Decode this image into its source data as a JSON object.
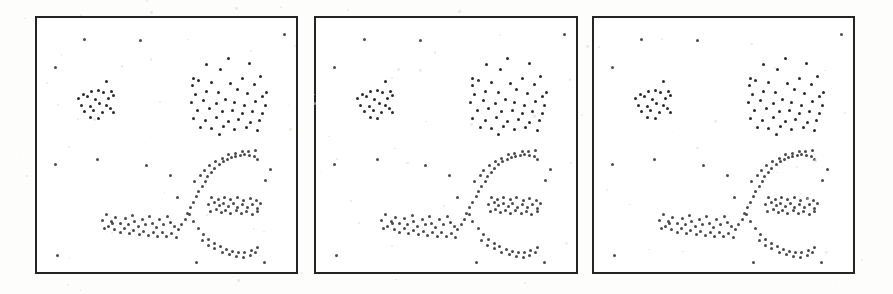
{
  "figure": {
    "name": "three-panel-scatter-cluster-figure",
    "background_color": "#fdfdfc",
    "panel_border_color": "#242424",
    "point_color": "#3a3a3a",
    "panel_count": 3
  },
  "panels": [
    {
      "id": "panel-1",
      "label": "",
      "x": 35,
      "y": 16,
      "width": 263,
      "height": 258
    },
    {
      "id": "panel-2",
      "label": "",
      "x": 314,
      "y": 16,
      "width": 264,
      "height": 258
    },
    {
      "id": "panel-3",
      "label": "",
      "x": 592,
      "y": 16,
      "width": 263,
      "height": 258
    }
  ],
  "chart_data": {
    "type": "scatter",
    "title": "",
    "subtitle": "",
    "xlabel": "",
    "ylabel": "",
    "xlim": [
      0,
      1
    ],
    "ylim": [
      0,
      1
    ],
    "grid": false,
    "legend": "none",
    "axis_ticks": false,
    "note": "Three identical panels each showing the same 2-D point set: a small compact cluster upper-left, a large diffuse cluster upper-right, a long curved (arc/banana) cluster across the lower half, plus sparse uniform noise points. Coordinates are normalized 0-1 with origin at the panel's top-left, x to the right and y downward.",
    "panels_share_data": true,
    "clusters": [
      {
        "name": "small-compact-cluster",
        "style": "dense",
        "count": 22,
        "points": [
          [
            0.262,
            0.245
          ],
          [
            0.175,
            0.296
          ],
          [
            0.206,
            0.286
          ],
          [
            0.232,
            0.281
          ],
          [
            0.251,
            0.289
          ],
          [
            0.283,
            0.283
          ],
          [
            0.155,
            0.313
          ],
          [
            0.19,
            0.305
          ],
          [
            0.221,
            0.316
          ],
          [
            0.271,
            0.312
          ],
          [
            0.29,
            0.301
          ],
          [
            0.167,
            0.338
          ],
          [
            0.2,
            0.345
          ],
          [
            0.238,
            0.332
          ],
          [
            0.262,
            0.34
          ],
          [
            0.18,
            0.364
          ],
          [
            0.215,
            0.358
          ],
          [
            0.248,
            0.369
          ],
          [
            0.279,
            0.352
          ],
          [
            0.29,
            0.366
          ],
          [
            0.203,
            0.388
          ],
          [
            0.232,
            0.392
          ]
        ]
      },
      {
        "name": "large-diffuse-cluster",
        "style": "dense",
        "count": 48,
        "points": [
          [
            0.735,
            0.153
          ],
          [
            0.652,
            0.176
          ],
          [
            0.818,
            0.172
          ],
          [
            0.6,
            0.232
          ],
          [
            0.62,
            0.24
          ],
          [
            0.705,
            0.198
          ],
          [
            0.79,
            0.233
          ],
          [
            0.862,
            0.226
          ],
          [
            0.598,
            0.262
          ],
          [
            0.672,
            0.248
          ],
          [
            0.745,
            0.252
          ],
          [
            0.836,
            0.256
          ],
          [
            0.885,
            0.288
          ],
          [
            0.608,
            0.295
          ],
          [
            0.65,
            0.286
          ],
          [
            0.697,
            0.29
          ],
          [
            0.77,
            0.275
          ],
          [
            0.81,
            0.293
          ],
          [
            0.867,
            0.305
          ],
          [
            0.592,
            0.33
          ],
          [
            0.64,
            0.322
          ],
          [
            0.688,
            0.333
          ],
          [
            0.724,
            0.318
          ],
          [
            0.76,
            0.33
          ],
          [
            0.8,
            0.338
          ],
          [
            0.842,
            0.326
          ],
          [
            0.878,
            0.338
          ],
          [
            0.616,
            0.36
          ],
          [
            0.662,
            0.352
          ],
          [
            0.712,
            0.365
          ],
          [
            0.752,
            0.358
          ],
          [
            0.792,
            0.37
          ],
          [
            0.83,
            0.362
          ],
          [
            0.87,
            0.372
          ],
          [
            0.6,
            0.392
          ],
          [
            0.648,
            0.4
          ],
          [
            0.69,
            0.388
          ],
          [
            0.735,
            0.402
          ],
          [
            0.775,
            0.395
          ],
          [
            0.82,
            0.408
          ],
          [
            0.858,
            0.398
          ],
          [
            0.628,
            0.425
          ],
          [
            0.672,
            0.432
          ],
          [
            0.718,
            0.422
          ],
          [
            0.76,
            0.436
          ],
          [
            0.805,
            0.428
          ],
          [
            0.848,
            0.44
          ],
          [
            0.7,
            0.455
          ]
        ]
      },
      {
        "name": "curved-arc-cluster",
        "style": "noise",
        "count": 92,
        "points": [
          [
            0.262,
            0.772
          ],
          [
            0.284,
            0.8
          ],
          [
            0.3,
            0.782
          ],
          [
            0.318,
            0.806
          ],
          [
            0.336,
            0.788
          ],
          [
            0.348,
            0.812
          ],
          [
            0.366,
            0.776
          ],
          [
            0.372,
            0.8
          ],
          [
            0.388,
            0.818
          ],
          [
            0.404,
            0.79
          ],
          [
            0.416,
            0.812
          ],
          [
            0.432,
            0.778
          ],
          [
            0.44,
            0.806
          ],
          [
            0.456,
            0.822
          ],
          [
            0.47,
            0.792
          ],
          [
            0.486,
            0.812
          ],
          [
            0.5,
            0.78
          ],
          [
            0.512,
            0.802
          ],
          [
            0.528,
            0.818
          ],
          [
            0.296,
            0.832
          ],
          [
            0.316,
            0.84
          ],
          [
            0.334,
            0.828
          ],
          [
            0.352,
            0.845
          ],
          [
            0.37,
            0.834
          ],
          [
            0.39,
            0.848
          ],
          [
            0.408,
            0.836
          ],
          [
            0.426,
            0.852
          ],
          [
            0.444,
            0.84
          ],
          [
            0.462,
            0.856
          ],
          [
            0.48,
            0.842
          ],
          [
            0.498,
            0.858
          ],
          [
            0.516,
            0.846
          ],
          [
            0.534,
            0.86
          ],
          [
            0.248,
            0.796
          ],
          [
            0.272,
            0.82
          ],
          [
            0.288,
            0.808
          ],
          [
            0.254,
            0.826
          ],
          [
            0.542,
            0.832
          ],
          [
            0.556,
            0.812
          ],
          [
            0.568,
            0.79
          ],
          [
            0.576,
            0.766
          ],
          [
            0.588,
            0.744
          ],
          [
            0.6,
            0.722
          ],
          [
            0.612,
            0.7
          ],
          [
            0.62,
            0.678
          ],
          [
            0.634,
            0.66
          ],
          [
            0.648,
            0.64
          ],
          [
            0.656,
            0.62
          ],
          [
            0.67,
            0.604
          ],
          [
            0.684,
            0.588
          ],
          [
            0.7,
            0.574
          ],
          [
            0.716,
            0.562
          ],
          [
            0.732,
            0.552
          ],
          [
            0.748,
            0.546
          ],
          [
            0.764,
            0.54
          ],
          [
            0.782,
            0.536
          ],
          [
            0.8,
            0.534
          ],
          [
            0.818,
            0.538
          ],
          [
            0.836,
            0.542
          ],
          [
            0.85,
            0.552
          ],
          [
            0.606,
            0.64
          ],
          [
            0.628,
            0.616
          ],
          [
            0.642,
            0.598
          ],
          [
            0.664,
            0.576
          ],
          [
            0.686,
            0.56
          ],
          [
            0.712,
            0.548
          ],
          [
            0.738,
            0.534
          ],
          [
            0.762,
            0.528
          ],
          [
            0.79,
            0.522
          ],
          [
            0.814,
            0.52
          ],
          [
            0.84,
            0.518
          ],
          [
            0.586,
            0.772
          ],
          [
            0.6,
            0.8
          ],
          [
            0.62,
            0.826
          ],
          [
            0.64,
            0.85
          ],
          [
            0.66,
            0.868
          ],
          [
            0.682,
            0.884
          ],
          [
            0.704,
            0.898
          ],
          [
            0.728,
            0.908
          ],
          [
            0.752,
            0.916
          ],
          [
            0.776,
            0.922
          ],
          [
            0.8,
            0.92
          ],
          [
            0.824,
            0.912
          ],
          [
            0.848,
            0.9
          ],
          [
            0.634,
            0.874
          ],
          [
            0.658,
            0.892
          ],
          [
            0.684,
            0.906
          ],
          [
            0.712,
            0.92
          ],
          [
            0.74,
            0.93
          ],
          [
            0.768,
            0.938
          ],
          [
            0.796,
            0.94
          ],
          [
            0.82,
            0.932
          ],
          [
            0.842,
            0.922
          ]
        ]
      },
      {
        "name": "right-dense-band",
        "style": "noise",
        "count": 30,
        "points": [
          [
            0.66,
            0.73
          ],
          [
            0.682,
            0.722
          ],
          [
            0.7,
            0.736
          ],
          [
            0.718,
            0.726
          ],
          [
            0.736,
            0.74
          ],
          [
            0.754,
            0.728
          ],
          [
            0.772,
            0.742
          ],
          [
            0.792,
            0.73
          ],
          [
            0.81,
            0.744
          ],
          [
            0.83,
            0.732
          ],
          [
            0.85,
            0.746
          ],
          [
            0.668,
            0.758
          ],
          [
            0.688,
            0.752
          ],
          [
            0.708,
            0.764
          ],
          [
            0.726,
            0.754
          ],
          [
            0.746,
            0.766
          ],
          [
            0.766,
            0.756
          ],
          [
            0.786,
            0.768
          ],
          [
            0.806,
            0.758
          ],
          [
            0.828,
            0.77
          ],
          [
            0.848,
            0.76
          ],
          [
            0.672,
            0.704
          ],
          [
            0.696,
            0.71
          ],
          [
            0.72,
            0.702
          ],
          [
            0.744,
            0.712
          ],
          [
            0.77,
            0.704
          ],
          [
            0.796,
            0.714
          ],
          [
            0.82,
            0.706
          ],
          [
            0.844,
            0.716
          ],
          [
            0.862,
            0.726
          ]
        ]
      },
      {
        "name": "sparse-noise-points",
        "style": "noise",
        "count": 14,
        "points": [
          [
            0.066,
            0.188
          ],
          [
            0.18,
            0.078
          ],
          [
            0.396,
            0.082
          ],
          [
            0.952,
            0.058
          ],
          [
            0.066,
            0.572
          ],
          [
            0.23,
            0.552
          ],
          [
            0.418,
            0.578
          ],
          [
            0.072,
            0.932
          ],
          [
            0.51,
            0.618
          ],
          [
            0.54,
            0.704
          ],
          [
            0.88,
            0.638
          ],
          [
            0.9,
            0.592
          ],
          [
            0.612,
            0.96
          ],
          [
            0.876,
            0.962
          ]
        ]
      }
    ]
  }
}
